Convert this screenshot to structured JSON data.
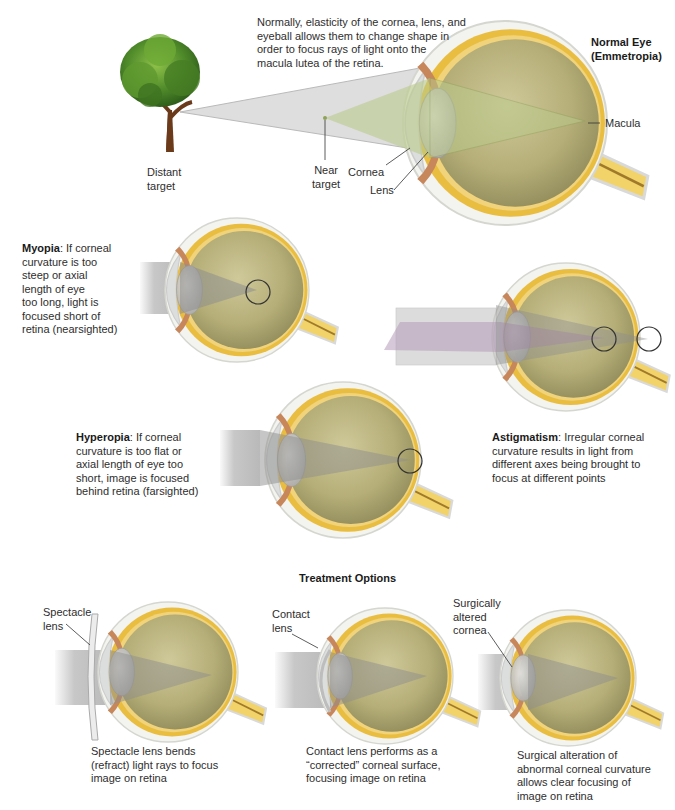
{
  "normal_eye": {
    "title_line1": "Normal Eye",
    "title_line2": "(Emmetropia)",
    "description": [
      "Normally, elasticity of the cornea, lens, and",
      "eyeball allows them to change shape in",
      "order to focus rays of light onto the",
      "macula lutea of the retina."
    ],
    "labels": {
      "distant_target": [
        "Distant",
        "target"
      ],
      "near_target": [
        "Near",
        "target"
      ],
      "cornea": "Cornea",
      "lens": "Lens",
      "macula": "Macula"
    }
  },
  "myopia": {
    "term": "Myopia",
    "desc_first": ": If corneal",
    "lines": [
      "curvature is too",
      "steep or axial",
      "length of eye",
      "too long, light is",
      "focused short of",
      "retina (nearsighted)"
    ]
  },
  "hyperopia": {
    "term": "Hyperopia",
    "desc_first": ": If corneal",
    "lines": [
      "curvature is too flat or",
      "axial length of eye too",
      "short, image is focused",
      "behind retina (farsighted)"
    ]
  },
  "astigmatism": {
    "term": "Astigmatism",
    "desc_first": ": Irregular corneal",
    "lines": [
      "curvature results in light from",
      "different axes being brought to",
      "focus at different points"
    ]
  },
  "treatment": {
    "heading": "Treatment Options",
    "options": [
      {
        "label": [
          "Spectacle",
          "lens"
        ],
        "caption": [
          "Spectacle lens bends",
          "(refract) light rays to focus",
          "image on retina"
        ]
      },
      {
        "label": [
          "Contact",
          "lens"
        ],
        "caption": [
          "Contact lens performs as a",
          "“corrected” corneal surface,",
          "focusing image on retina"
        ]
      },
      {
        "label": [
          "Surgically",
          "altered",
          "cornea"
        ],
        "caption": [
          "Surgical alteration of",
          "abnormal corneal curvature",
          "allows clear focusing of",
          "image on retina"
        ]
      }
    ]
  },
  "colors": {
    "vitreous": "#b8b27a",
    "sclera_yellow": "#e6b93a",
    "iris_brown": "#c8875a",
    "light_beam_gray": "#9a9a9a",
    "near_beam_green": "#b9c98a",
    "astig_beam_purple": "#b59ab8",
    "tree_green": "#4f8a2a"
  }
}
